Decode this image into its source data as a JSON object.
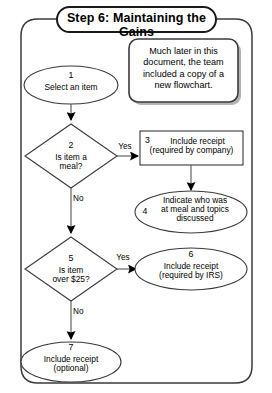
{
  "diagram": {
    "title": "Step 6: Maintaining the Gains",
    "comment": {
      "line1": "Much later in this",
      "line2": "document, the team",
      "line3": "included a copy of a",
      "line4": "new flowchart."
    },
    "nodes": [
      {
        "id": "1",
        "shape": "oval",
        "number": "1",
        "lines": [
          "Select an item"
        ]
      },
      {
        "id": "2",
        "shape": "diamond",
        "number": "2",
        "lines": [
          "Is item a",
          "meal?"
        ]
      },
      {
        "id": "3",
        "shape": "rectangle",
        "number": "3",
        "lines": [
          "Include receipt",
          "(required by company)"
        ]
      },
      {
        "id": "4",
        "shape": "oval",
        "number": "4",
        "lines": [
          "Indicate who was",
          "at meal and topics",
          "discussed"
        ]
      },
      {
        "id": "5",
        "shape": "diamond",
        "number": "5",
        "lines": [
          "Is item",
          "over $25?"
        ]
      },
      {
        "id": "6",
        "shape": "oval",
        "number": "6",
        "lines": [
          "Include receipt",
          "(required by IRS)"
        ]
      },
      {
        "id": "7",
        "shape": "oval",
        "number": "7",
        "lines": [
          "Include receipt",
          "(optional)"
        ]
      }
    ],
    "edge_labels": {
      "yes_from_2": "Yes",
      "no_from_2": "No",
      "yes_from_5": "Yes",
      "no_from_5": "No"
    },
    "colors": {
      "stroke": "#3a3a3a",
      "title_stroke": "#1a1a1a",
      "fill": "#ffffff",
      "shadow": "#b4b4b4",
      "arrow": "#000000",
      "background": "#ffffff"
    }
  }
}
